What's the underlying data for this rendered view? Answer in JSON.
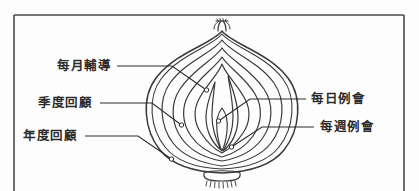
{
  "figure": {
    "background_color": "#fdfdfd",
    "frame_color": "#4a4a4a",
    "line_color": "#3a3a3a",
    "text_color": "#2c2c2c",
    "central_graphic": "onion-cross-section"
  },
  "labels": {
    "left": [
      {
        "id": "monthly-coaching",
        "text": "每月輔導"
      },
      {
        "id": "quarterly-review",
        "text": "季度回顧"
      },
      {
        "id": "annual-review",
        "text": "年度回顧"
      }
    ],
    "right": [
      {
        "id": "daily-meeting",
        "text": "每日例會"
      },
      {
        "id": "weekly-meeting",
        "text": "每週例會"
      }
    ]
  }
}
